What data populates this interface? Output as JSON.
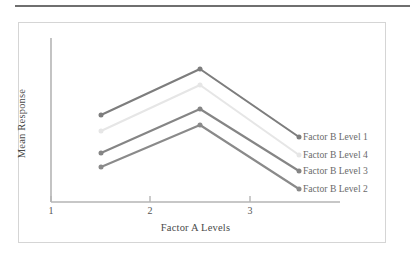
{
  "figure": {
    "border_color": "#d5d5d5",
    "rule_color": "#6f6f6f",
    "background": "#ffffff"
  },
  "chart_data": {
    "type": "line",
    "title": "",
    "subtitle": "",
    "xlabel": "Factor A Levels",
    "ylabel": "Mean Response",
    "categories": [
      "1",
      "2",
      "3"
    ],
    "x": [
      1,
      2,
      3
    ],
    "xlim": [
      0.6,
      3.4
    ],
    "ylim": [
      0,
      10
    ],
    "grid": false,
    "legend_position": "right-inline-at-line-ends",
    "axis_ticks_y": false,
    "axis_ticks_x": true,
    "series": [
      {
        "name": "Factor B Level 1",
        "color": "#7d7d7d",
        "values": [
          6.35,
          8.65,
          5.25
        ],
        "marker": "circle"
      },
      {
        "name": "Factor B Level 4",
        "color": "#e6e6e6",
        "values": [
          5.55,
          7.85,
          4.35
        ],
        "marker": "circle"
      },
      {
        "name": "Factor B Level 3",
        "color": "#858585",
        "values": [
          4.45,
          6.65,
          3.55
        ],
        "marker": "circle"
      },
      {
        "name": "Factor B Level 2",
        "color": "#8a8a8a",
        "values": [
          3.75,
          5.85,
          2.65
        ],
        "marker": "circle"
      }
    ],
    "annotations": []
  },
  "axes": {
    "y_title": "Mean Response",
    "x_title": "Factor A Levels",
    "x_tick_labels": [
      "1",
      "2",
      "3"
    ],
    "axis_color": "#b5b5b5"
  },
  "legend": {
    "entries": [
      {
        "label": "Factor B Level 1"
      },
      {
        "label": "Factor B Level 4"
      },
      {
        "label": "Factor B Level 3"
      },
      {
        "label": "Factor B Level 2"
      }
    ]
  }
}
